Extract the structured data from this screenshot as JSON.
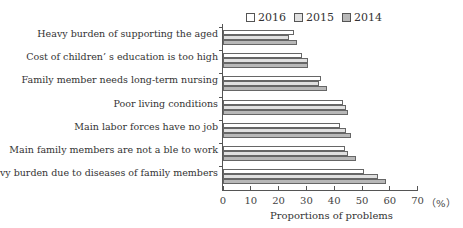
{
  "chart_data": {
    "type": "bar",
    "orientation": "horizontal",
    "title": "",
    "xlabel": "Proportions of problems",
    "ylabel": "",
    "unit": "（%）",
    "xlim": [
      0,
      70
    ],
    "xticks": [
      "0",
      "10",
      "20",
      "30",
      "40",
      "50",
      "60",
      "70"
    ],
    "legend_position": "top",
    "categories": [
      "Heavy burden of supporting the aged",
      "Cost of children’ s education is too high",
      "Family member needs long-term nursing",
      "Poor living conditions",
      "Main labor forces have no job",
      "Main family members are not a ble to work",
      "Heavy burden due to diseases of family members"
    ],
    "series": [
      {
        "name": "2016",
        "color": "#ffffff",
        "values": [
          25.5,
          28.4,
          35.3,
          43.2,
          42.0,
          44.0,
          50.7
        ]
      },
      {
        "name": "2015",
        "color": "#e0e0e0",
        "values": [
          23.7,
          30.5,
          34.5,
          44.2,
          44.2,
          45.0,
          55.8
        ]
      },
      {
        "name": "2014",
        "color": "#b8b8b8",
        "values": [
          26.6,
          30.5,
          37.3,
          45.0,
          46.0,
          48.0,
          58.6
        ]
      }
    ]
  }
}
